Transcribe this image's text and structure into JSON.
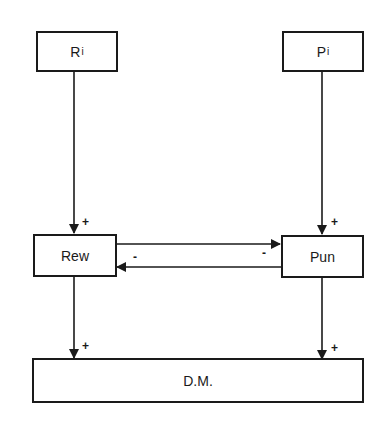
{
  "diagram": {
    "nodes": {
      "ri": {
        "label": "R",
        "subscript": "i"
      },
      "pi": {
        "label": "P",
        "subscript": "i"
      },
      "rew": {
        "label": "Rew"
      },
      "pun": {
        "label": "Pun"
      },
      "dm": {
        "label": "D.M."
      }
    },
    "edges": [
      {
        "from": "R_i",
        "to": "Rew",
        "sign": "+"
      },
      {
        "from": "P_i",
        "to": "Pun",
        "sign": "+"
      },
      {
        "from": "Rew",
        "to": "Pun",
        "sign": "-"
      },
      {
        "from": "Pun",
        "to": "Rew",
        "sign": "-"
      },
      {
        "from": "Rew",
        "to": "D.M.",
        "sign": "+"
      },
      {
        "from": "Pun",
        "to": "D.M.",
        "sign": "+"
      }
    ],
    "signs": {
      "ri_rew": "+",
      "pi_pun": "+",
      "rew_pun": "-",
      "pun_rew": "-",
      "rew_dm": "+",
      "pun_dm": "+"
    },
    "colors": {
      "stroke": "#1a1a1a",
      "background": "#ffffff"
    }
  }
}
